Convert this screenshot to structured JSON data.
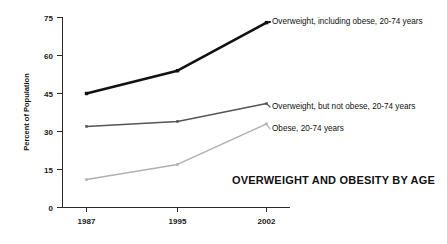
{
  "chart_data": {
    "type": "line",
    "title": "OVERWEIGHT AND OBESITY BY AGE",
    "xlabel": "",
    "ylabel": "Percent of Population",
    "categories": [
      "1987",
      "1995",
      "2002"
    ],
    "x": [
      1987,
      1995,
      2002
    ],
    "xlim": [
      1987,
      2002
    ],
    "ylim": [
      0,
      75
    ],
    "yticks": [
      0,
      15,
      30,
      45,
      60,
      75
    ],
    "ytick_labels": [
      "0",
      "15",
      "30",
      "45",
      "60",
      "75"
    ],
    "grid": false,
    "legend_position": "inline-right-of-line-ends",
    "series": [
      {
        "name": "Overweight, including obese, 20-74 years",
        "values": [
          45,
          54,
          73
        ],
        "color": "#111111",
        "width": 2.6
      },
      {
        "name": "Overweight, but not obese, 20-74 years",
        "values": [
          32,
          34,
          41
        ],
        "color": "#555555",
        "width": 1.5
      },
      {
        "name": "Obese, 20-74 years",
        "values": [
          11,
          17,
          33
        ],
        "color": "#b0b0b0",
        "width": 1.5
      }
    ]
  },
  "axis": {
    "y_title": "Percent of Population",
    "y_labels": [
      "75",
      "60",
      "45",
      "30",
      "15",
      "0"
    ],
    "x_labels": [
      "1987",
      "1995",
      "2002"
    ]
  },
  "labels": {
    "series_1": "Overweight, including obese, 20-74 years",
    "series_2": "Overweight, but not obese, 20-74 years",
    "series_3": "Obese, 20-74 years",
    "title": "OVERWEIGHT AND OBESITY BY AGE"
  }
}
